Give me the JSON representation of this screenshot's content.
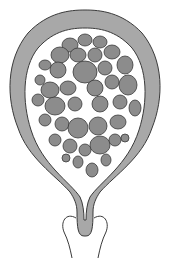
{
  "diagram": {
    "colors": {
      "wall": "#a8a8a8",
      "outline": "#3a3a3a",
      "vesicle": "#8c8c8c",
      "background": "#ffffff"
    }
  }
}
